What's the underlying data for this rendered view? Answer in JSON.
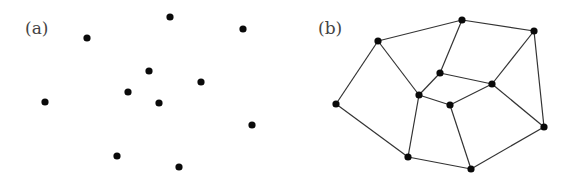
{
  "figure": {
    "width": 574,
    "height": 181,
    "colors": {
      "background": "#ffffff",
      "node": "#0a0a0a",
      "edge": "#333333",
      "label": "#444444"
    },
    "node_radius": 3.6
  },
  "panels": [
    {
      "id": "a",
      "label": "(a)",
      "label_pos": {
        "x": 25,
        "y": 34
      },
      "description": "scattered points, no edges",
      "nodes": [
        {
          "id": "p1",
          "x": 87,
          "y": 38
        },
        {
          "id": "p2",
          "x": 170,
          "y": 17
        },
        {
          "id": "p3",
          "x": 243,
          "y": 29
        },
        {
          "id": "p4",
          "x": 149,
          "y": 71
        },
        {
          "id": "p5",
          "x": 201,
          "y": 82
        },
        {
          "id": "p6",
          "x": 128,
          "y": 92
        },
        {
          "id": "p7",
          "x": 159,
          "y": 103
        },
        {
          "id": "p8",
          "x": 45,
          "y": 102
        },
        {
          "id": "p9",
          "x": 252,
          "y": 125
        },
        {
          "id": "p10",
          "x": 117,
          "y": 156
        },
        {
          "id": "p11",
          "x": 179,
          "y": 167
        }
      ],
      "edges": []
    },
    {
      "id": "b",
      "label": "(b)",
      "label_pos": {
        "x": 318,
        "y": 34
      },
      "description": "points connected as planar graph",
      "nodes": [
        {
          "id": "A",
          "x": 378,
          "y": 41
        },
        {
          "id": "B",
          "x": 462,
          "y": 20
        },
        {
          "id": "C",
          "x": 534,
          "y": 31
        },
        {
          "id": "D",
          "x": 440,
          "y": 73
        },
        {
          "id": "E",
          "x": 492,
          "y": 84
        },
        {
          "id": "F",
          "x": 419,
          "y": 95
        },
        {
          "id": "G",
          "x": 450,
          "y": 105
        },
        {
          "id": "H",
          "x": 336,
          "y": 104
        },
        {
          "id": "I",
          "x": 544,
          "y": 127
        },
        {
          "id": "J",
          "x": 408,
          "y": 157
        },
        {
          "id": "K",
          "x": 471,
          "y": 169
        }
      ],
      "edges": [
        [
          "A",
          "B"
        ],
        [
          "B",
          "C"
        ],
        [
          "A",
          "H"
        ],
        [
          "A",
          "F"
        ],
        [
          "B",
          "D"
        ],
        [
          "C",
          "E"
        ],
        [
          "C",
          "I"
        ],
        [
          "D",
          "F"
        ],
        [
          "D",
          "E"
        ],
        [
          "F",
          "G"
        ],
        [
          "G",
          "E"
        ],
        [
          "E",
          "I"
        ],
        [
          "H",
          "J"
        ],
        [
          "F",
          "J"
        ],
        [
          "G",
          "K"
        ],
        [
          "J",
          "K"
        ],
        [
          "K",
          "I"
        ]
      ]
    }
  ]
}
